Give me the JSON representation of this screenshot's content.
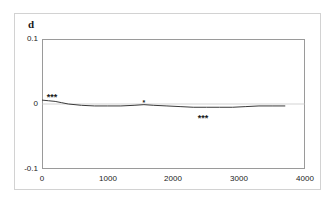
{
  "figure": {
    "panel_label": "d",
    "background_color": "#ffffff",
    "frame_color": "#d2d2d2",
    "axis_color": "#9a9a9a",
    "line_color": "#3a3a3a"
  },
  "chart_data": {
    "type": "line",
    "title": "d",
    "xlabel": "",
    "ylabel": "",
    "xlim": [
      0,
      4000
    ],
    "ylim": [
      -0.1,
      0.1
    ],
    "xticks": [
      0,
      1000,
      2000,
      3000,
      4000
    ],
    "xtick_labels": [
      "0",
      "1000",
      "2000",
      "3000",
      "4000"
    ],
    "yticks": [
      -0.1,
      0,
      0.1
    ],
    "ytick_labels": [
      "-0.1",
      "0",
      "0.1"
    ],
    "grid": false,
    "legend": false,
    "zero_reference_line": 0,
    "series": [
      {
        "name": "d",
        "x": [
          0,
          100,
          200,
          300,
          400,
          600,
          800,
          1000,
          1200,
          1400,
          1550,
          1700,
          1900,
          2100,
          2300,
          2500,
          2700,
          2900,
          3100,
          3300,
          3500,
          3700
        ],
        "values": [
          0.006,
          0.005,
          0.004,
          0.002,
          0.0,
          -0.002,
          -0.003,
          -0.003,
          -0.003,
          -0.002,
          -0.001,
          -0.002,
          -0.003,
          -0.004,
          -0.005,
          -0.005,
          -0.005,
          -0.005,
          -0.004,
          -0.003,
          -0.003,
          -0.003
        ]
      }
    ],
    "annotations": [
      {
        "text": "***",
        "x": 150,
        "y": 0.011,
        "size": "normal"
      },
      {
        "text": "*",
        "x": 1550,
        "y": 0.002,
        "size": "small"
      },
      {
        "text": "***",
        "x": 2450,
        "y": -0.022,
        "size": "normal"
      }
    ]
  }
}
